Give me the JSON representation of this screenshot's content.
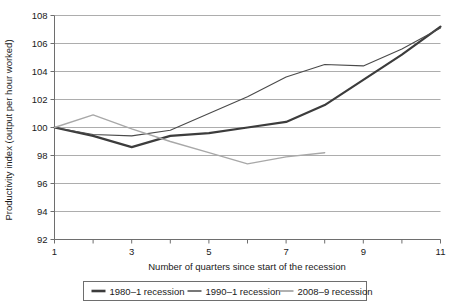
{
  "chart_data": {
    "type": "line",
    "title": "",
    "xlabel": "Number of quarters since start of the recession",
    "ylabel": "Productivity index (output per hour worked)",
    "xlim": [
      1,
      11
    ],
    "ylim": [
      92,
      108
    ],
    "xticks": [
      1,
      2,
      3,
      4,
      5,
      6,
      7,
      8,
      9,
      10,
      11
    ],
    "xticklabels": [
      "1",
      "",
      "3",
      "",
      "5",
      "",
      "7",
      "",
      "9",
      "",
      "11"
    ],
    "yticks": [
      92,
      94,
      96,
      98,
      100,
      102,
      104,
      106,
      108
    ],
    "yticklabels": [
      "92",
      "94",
      "96",
      "98",
      "100",
      "102",
      "104",
      "106",
      "108"
    ],
    "grid": "horizontal",
    "legend_position": "bottom",
    "series": [
      {
        "name": "1980–1 recession",
        "color": "#3c3c3c",
        "width": 2.2,
        "x": [
          1,
          2,
          3,
          4,
          5,
          6,
          7,
          8,
          9,
          10,
          11
        ],
        "values": [
          100.0,
          99.4,
          98.6,
          99.4,
          99.6,
          100.0,
          100.4,
          101.6,
          103.4,
          105.2,
          107.2
        ]
      },
      {
        "name": "1990–1 recession",
        "color": "#4a4a4a",
        "width": 1.1,
        "x": [
          1,
          2,
          3,
          4,
          5,
          6,
          7,
          8,
          9,
          10,
          11
        ],
        "values": [
          100.0,
          99.5,
          99.4,
          99.8,
          101.0,
          102.2,
          103.6,
          104.5,
          104.4,
          105.6,
          107.1
        ]
      },
      {
        "name": "2008–9 recession",
        "color": "#a8a8a8",
        "width": 1.4,
        "x": [
          1,
          2,
          3,
          4,
          5,
          6,
          7,
          8
        ],
        "values": [
          100.0,
          100.9,
          99.9,
          99.0,
          98.2,
          97.4,
          97.9,
          98.2
        ]
      }
    ]
  },
  "legend": {
    "items": [
      {
        "label": "1980–1 recession",
        "color": "#3c3c3c"
      },
      {
        "label": "1990–1 recession",
        "color": "#4a4a4a"
      },
      {
        "label": "2008–9 recession",
        "color": "#a8a8a8"
      }
    ]
  }
}
